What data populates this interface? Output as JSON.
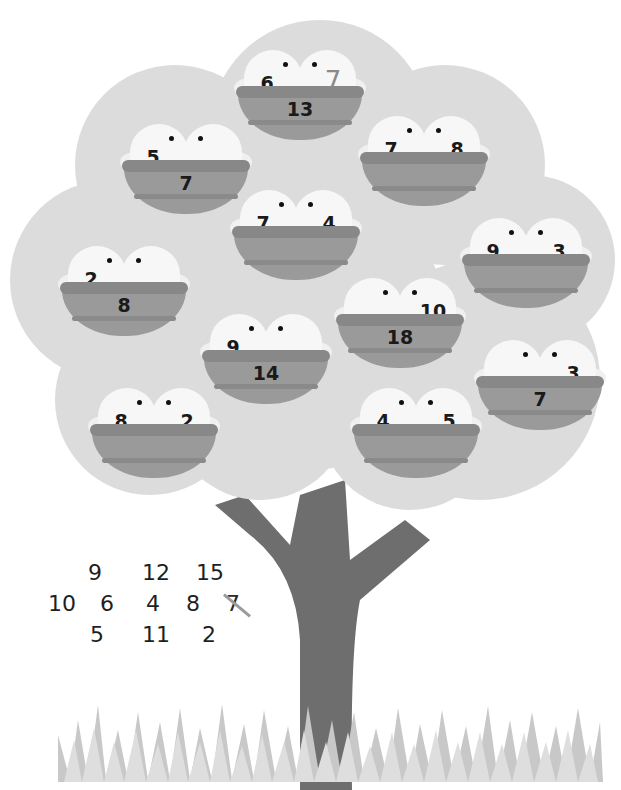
{
  "puzzle": {
    "description": "Tree with bird nests; two birds per nest carry addends, nest shows their sum",
    "nests": [
      {
        "id": "top-center",
        "left_bird": "6",
        "right_bird": "7",
        "sum": "13",
        "right_answered": true
      },
      {
        "id": "upper-left",
        "left_bird": "5",
        "right_bird": "",
        "sum": "7"
      },
      {
        "id": "upper-right",
        "left_bird": "7",
        "right_bird": "8",
        "sum": ""
      },
      {
        "id": "center",
        "left_bird": "7",
        "right_bird": "4",
        "sum": ""
      },
      {
        "id": "right",
        "left_bird": "9",
        "right_bird": "3",
        "sum": ""
      },
      {
        "id": "left",
        "left_bird": "2",
        "right_bird": "",
        "sum": "8"
      },
      {
        "id": "mid-right",
        "left_bird": "",
        "right_bird": "10",
        "sum": "18"
      },
      {
        "id": "mid-left",
        "left_bird": "9",
        "right_bird": "",
        "sum": "14"
      },
      {
        "id": "far-right",
        "left_bird": "",
        "right_bird": "3",
        "sum": "7"
      },
      {
        "id": "lower-left",
        "left_bird": "8",
        "right_bird": "2",
        "sum": ""
      },
      {
        "id": "lower-right",
        "left_bird": "4",
        "right_bird": "5",
        "sum": ""
      }
    ]
  },
  "number_bank": {
    "row1": [
      "9",
      "12",
      "15"
    ],
    "row2": [
      "10",
      "6",
      "4",
      "8",
      "7"
    ],
    "row3": [
      "5",
      "11",
      "2"
    ],
    "crossed_out": "7"
  },
  "colors": {
    "canopy": "#dcdcdc",
    "trunk": "#6e6e6e",
    "nest": "#9a9a9a",
    "bird": "#f7f7f7",
    "grass": "#c8c8c8"
  }
}
